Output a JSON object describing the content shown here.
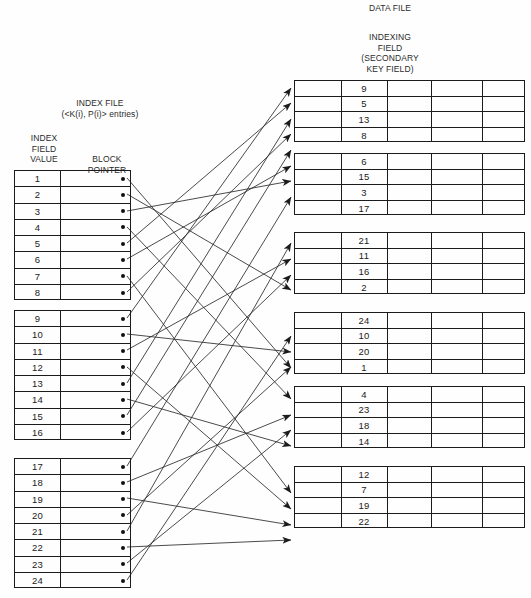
{
  "titles": {
    "data_file": "DATA FILE",
    "indexing_field_l1": "INDEXING",
    "indexing_field_l2": "FIELD",
    "indexing_field_l3": "(SECONDARY",
    "indexing_field_l4": "KEY FIELD)",
    "index_file_l1": "INDEX FILE",
    "index_file_l2": "(<K(i), P(i)> entries)",
    "index_col_key_l1": "INDEX",
    "index_col_key_l2": "FIELD",
    "index_col_key_l3": "VALUE",
    "index_col_ptr_l1": "BLOCK",
    "index_col_ptr_l2": "POINTER"
  },
  "index_file": {
    "blocks": [
      {
        "entries": [
          {
            "key": "1"
          },
          {
            "key": "2"
          },
          {
            "key": "3"
          },
          {
            "key": "4"
          },
          {
            "key": "5"
          },
          {
            "key": "6"
          },
          {
            "key": "7"
          },
          {
            "key": "8"
          }
        ]
      },
      {
        "entries": [
          {
            "key": "9"
          },
          {
            "key": "10"
          },
          {
            "key": "11"
          },
          {
            "key": "12"
          },
          {
            "key": "13"
          },
          {
            "key": "14"
          },
          {
            "key": "15"
          },
          {
            "key": "16"
          }
        ]
      },
      {
        "entries": [
          {
            "key": "17"
          },
          {
            "key": "18"
          },
          {
            "key": "19"
          },
          {
            "key": "20"
          },
          {
            "key": "21"
          },
          {
            "key": "22"
          },
          {
            "key": "23"
          },
          {
            "key": "24"
          }
        ]
      }
    ]
  },
  "data_file": {
    "blocks": [
      {
        "records": [
          "9",
          "5",
          "13",
          "8"
        ]
      },
      {
        "records": [
          "6",
          "15",
          "3",
          "17"
        ]
      },
      {
        "records": [
          "21",
          "11",
          "16",
          "2"
        ]
      },
      {
        "records": [
          "24",
          "10",
          "20",
          "1"
        ]
      },
      {
        "records": [
          "4",
          "23",
          "18",
          "14"
        ]
      },
      {
        "records": [
          "12",
          "7",
          "19",
          "22"
        ]
      }
    ]
  },
  "colors": {
    "line": "#1b1b1b",
    "text": "#1a1a1a",
    "dot": "#111111"
  }
}
